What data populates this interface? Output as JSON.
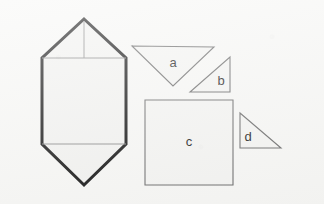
{
  "figure": {
    "background_color": "#f7f7f5",
    "thick_stroke_color": "#111111",
    "thin_stroke_color": "#8c8c8c",
    "fill_color": "#f2f2f0",
    "label_color": "#1a1a1a",
    "shapes": [
      {
        "id": "hexagon",
        "name": "elongated-hexagon",
        "label": "",
        "outline_points": "84,19 126,58 126,144 84,185 42,144 42,58",
        "fold_lines": [
          {
            "name": "top-fold-line",
            "x1": 42,
            "y1": 58,
            "x2": 126,
            "y2": 58
          },
          {
            "name": "bottom-fold-line",
            "x1": 42,
            "y1": 144,
            "x2": 126,
            "y2": 144
          },
          {
            "name": "apex-median-line",
            "x1": 84,
            "y1": 20,
            "x2": 84,
            "y2": 58
          }
        ]
      },
      {
        "id": "a",
        "name": "triangle-a",
        "label": "a",
        "outline_points": "132,46 214,47 173,86",
        "label_x": 173,
        "label_y": 64
      },
      {
        "id": "b",
        "name": "triangle-b",
        "label": "b",
        "outline_points": "230,57 230,92 190,92",
        "label_x": 221,
        "label_y": 82
      },
      {
        "id": "c",
        "name": "square-c",
        "label": "c",
        "outline_points": "145,100 233,100 233,185 145,185",
        "label_x": 189,
        "label_y": 143
      },
      {
        "id": "d",
        "name": "triangle-d",
        "label": "d",
        "outline_points": "240,113 281,148 240,148",
        "label_x": 248,
        "label_y": 138
      }
    ]
  }
}
